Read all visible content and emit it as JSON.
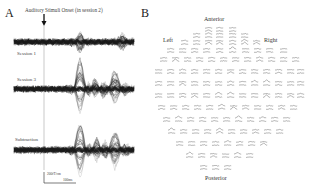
{
  "panel_a": {
    "letter": "A",
    "title": "Auditory Stimuli Onset (in session 2)",
    "arrow_icon": "down-arrow",
    "rows": [
      {
        "label": "Session 1",
        "center_y": 42
      },
      {
        "label": "Session 3",
        "center_y": 89
      },
      {
        "label": "Subtraction",
        "center_y": 150
      }
    ],
    "scale_bar": {
      "amplitude": "200fT/cm",
      "time": "100ms"
    }
  },
  "panel_b": {
    "letter": "B",
    "anterior": "Anterior",
    "left": "Left",
    "right": "Right",
    "posterior": "Posterior"
  },
  "colors": {
    "trace_dark": "#1a1a1a",
    "trace_light": "#888888",
    "onset_line": "#bbbbbb",
    "text": "#333333"
  },
  "chart_data": [
    {
      "type": "line",
      "title": "Auditory Stimuli Onset (in session 2)",
      "subtitle": "Panel A: butterfly plot of MEG sensor waveforms",
      "series": [
        {
          "name": "Session 1",
          "description": "dense baseline noise band with small evoked deflections ~100-150ms and ~250ms after onset"
        },
        {
          "name": "Session 3",
          "description": "baseline band with large evoked peaks ~120ms and ~250ms after onset"
        },
        {
          "name": "Subtraction",
          "description": "baseline band with evoked peaks ~120ms and ~250ms after onset"
        }
      ],
      "annotations": [
        "Auditory Stimuli Onset (in session 2)",
        "200fT/cm",
        "100ms"
      ],
      "xlabel": "time",
      "ylabel": "field gradient",
      "grid": false
    },
    {
      "type": "scatter",
      "title": "Panel B: sensor topography",
      "annotations": [
        "Anterior",
        "Left",
        "Right",
        "Posterior"
      ],
      "description": "planar gradiometer waveform pairs arranged in head-shaped layout"
    }
  ]
}
